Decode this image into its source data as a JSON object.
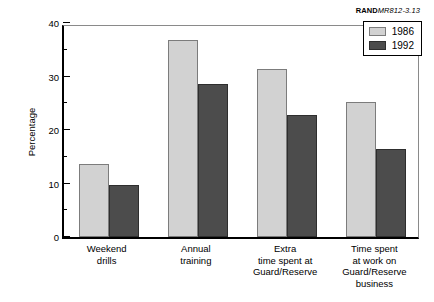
{
  "source_caption": {
    "bold_part": "RAND",
    "italic_part": "MR812-3.13"
  },
  "legend": {
    "position": "top-right",
    "entries": [
      {
        "label": "1986",
        "color": "#d2d2d2"
      },
      {
        "label": "1992",
        "color": "#4c4c4c"
      }
    ]
  },
  "y_axis": {
    "label": "Percentage",
    "major_ticks": [
      "0",
      "10",
      "20",
      "30",
      "40"
    ],
    "minor_ticks": [
      "5",
      "15",
      "25",
      "35"
    ]
  },
  "chart_data": {
    "type": "bar",
    "title": "",
    "xlabel": "",
    "ylabel": "Percentage",
    "ylim": [
      0,
      40
    ],
    "ytick_step": 10,
    "yminor_step": 5,
    "grid": false,
    "legend_position": "top-right",
    "categories": [
      "Weekend\ndrills",
      "Annual\ntraining",
      "Extra\ntime spent at\nGuard/Reserve",
      "Time spent\nat work on\nGuard/Reserve\nbusiness"
    ],
    "categories_flat": [
      "Weekend drills",
      "Annual training",
      "Extra time spent at Guard/Reserve",
      "Time spent at work on Guard/Reserve business"
    ],
    "series": [
      {
        "name": "1986",
        "color": "#d2d2d2",
        "values": [
          13.6,
          36.8,
          31.4,
          25.3
        ]
      },
      {
        "name": "1992",
        "color": "#4c4c4c",
        "values": [
          9.7,
          28.6,
          22.9,
          16.4
        ]
      }
    ]
  }
}
